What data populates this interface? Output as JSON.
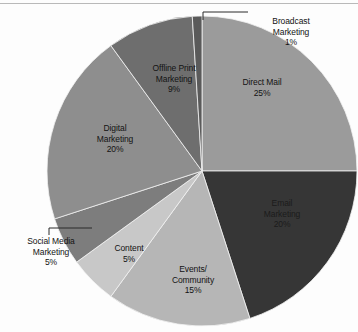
{
  "chart_data": {
    "type": "pie",
    "title": "",
    "subtitle": "",
    "xlabel": "",
    "ylabel": "",
    "legend_position": "none",
    "grid": false,
    "units": "percent",
    "total": 100,
    "start_angle_deg": 0,
    "direction": "clockwise",
    "categories": [
      "Direct Mail",
      "Email Marketing",
      "Events/ Community",
      "Content",
      "Social Media Marketing",
      "Digital Marketing",
      "Offline Print Marketing",
      "Broadcast Marketing"
    ],
    "values": [
      25,
      20,
      15,
      5,
      5,
      20,
      9,
      1
    ],
    "value_labels": [
      "25%",
      "20%",
      "15%",
      "5%",
      "5%",
      "20%",
      "9%",
      "1%"
    ],
    "colors": [
      "#9b9b9b",
      "#363636",
      "#b6b6b6",
      "#c8c8c8",
      "#7d7d7d",
      "#8e8e8e",
      "#6e6e6e",
      "#5a5a5a"
    ],
    "slices": [
      {
        "name": "Direct Mail",
        "value": 25,
        "value_label": "25%",
        "color": "#9b9b9b",
        "label_lines": [
          "Direct Mail",
          "25%"
        ],
        "label_placement": "inside",
        "leader_line": false
      },
      {
        "name": "Email Marketing",
        "value": 20,
        "value_label": "20%",
        "color": "#363636",
        "label_lines": [
          "Email",
          "Marketing",
          "20%"
        ],
        "label_placement": "inside-dark",
        "leader_line": false
      },
      {
        "name": "Events/ Community",
        "value": 15,
        "value_label": "15%",
        "color": "#b6b6b6",
        "label_lines": [
          "Events/",
          "Community",
          "15%"
        ],
        "label_placement": "inside",
        "leader_line": false
      },
      {
        "name": "Content",
        "value": 5,
        "value_label": "5%",
        "color": "#c8c8c8",
        "label_lines": [
          "Content",
          "5%"
        ],
        "label_placement": "inside",
        "leader_line": false
      },
      {
        "name": "Social Media Marketing",
        "value": 5,
        "value_label": "5%",
        "color": "#7d7d7d",
        "label_lines": [
          "Social Media",
          "Marketing",
          "5%"
        ],
        "label_placement": "outside-left",
        "leader_line": true
      },
      {
        "name": "Digital Marketing",
        "value": 20,
        "value_label": "20%",
        "color": "#8e8e8e",
        "label_lines": [
          "Digital",
          "Marketing",
          "20%"
        ],
        "label_placement": "inside",
        "leader_line": false
      },
      {
        "name": "Offline Print Marketing",
        "value": 9,
        "value_label": "9%",
        "color": "#6e6e6e",
        "label_lines": [
          "Offline Print",
          "Marketing",
          "9%"
        ],
        "label_placement": "inside",
        "leader_line": false
      },
      {
        "name": "Broadcast Marketing",
        "value": 1,
        "value_label": "1%",
        "color": "#5a5a5a",
        "label_lines": [
          "Broadcast",
          "Marketing",
          "1%"
        ],
        "label_placement": "outside-top-right",
        "leader_line": true
      }
    ]
  },
  "labels": {
    "direct_mail": {
      "l1": "Direct Mail",
      "l2": "25%"
    },
    "email_marketing": {
      "l1": "Email",
      "l2": "Marketing",
      "l3": "20%"
    },
    "events_community": {
      "l1": "Events/",
      "l2": "Community",
      "l3": "15%"
    },
    "content": {
      "l1": "Content",
      "l2": "5%"
    },
    "social_media": {
      "l1": "Social Media",
      "l2": "Marketing",
      "l3": "5%"
    },
    "digital_marketing": {
      "l1": "Digital",
      "l2": "Marketing",
      "l3": "20%"
    },
    "offline_print": {
      "l1": "Offline Print",
      "l2": "Marketing",
      "l3": "9%"
    },
    "broadcast": {
      "l1": "Broadcast",
      "l2": "Marketing",
      "l3": "1%"
    }
  },
  "style": {
    "background": "#fdfdfd",
    "rule_color": "#b9b9b9",
    "label_color": "#131313",
    "leader_color": "#2b2b2b"
  }
}
